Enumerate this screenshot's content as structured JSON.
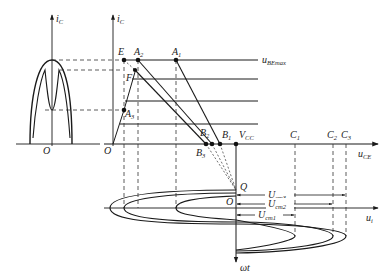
{
  "diagram": {
    "type": "transistor-amplifier-graphical-analysis",
    "left_plot": {
      "y_axis_label": "i",
      "y_axis_sub": "C",
      "origin_label": "O"
    },
    "main_plot": {
      "y_axis_label": "i",
      "y_axis_sub": "C",
      "x_axis_label": "u",
      "x_axis_sub": "CE",
      "origin_label": "O",
      "top_curve_label": "u",
      "top_curve_sub": "BEmax",
      "points": {
        "E": "E",
        "F": "F",
        "A1": {
          "main": "A",
          "sub": "1"
        },
        "A2": {
          "main": "A",
          "sub": "2"
        },
        "A3": {
          "main": "A",
          "sub": "3"
        },
        "B1": {
          "main": "B",
          "sub": "1"
        },
        "B2": {
          "main": "B",
          "sub": "2"
        },
        "B3": {
          "main": "B",
          "sub": "3"
        },
        "VCC": {
          "main": "V",
          "sub": "CC"
        },
        "C1": {
          "main": "C",
          "sub": "1"
        },
        "C2": {
          "main": "C",
          "sub": "2"
        },
        "C3": {
          "main": "C",
          "sub": "3"
        },
        "Q": "Q"
      }
    },
    "bottom_plot": {
      "x_axis_label": "u",
      "x_axis_sub": "i",
      "y_axis_label": "ωt",
      "origin_label": "O",
      "amplitudes": [
        {
          "main": "U",
          "sub": "cm3"
        },
        {
          "main": "U",
          "sub": "cm2"
        },
        {
          "main": "U",
          "sub": "cm1"
        }
      ]
    },
    "colors": {
      "line": "#1a1a1a",
      "dashed": "#333333",
      "background": "#ffffff"
    }
  }
}
